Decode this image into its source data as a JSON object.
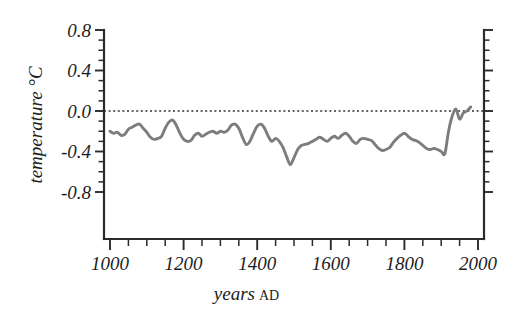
{
  "chart_data": {
    "type": "line",
    "title": "",
    "xlabel": "years AD",
    "xlabel_main": "years",
    "xlabel_suffix": "AD",
    "ylabel": "temperature °C",
    "xlim": [
      1000,
      2030
    ],
    "ylim": [
      -1.05,
      0.85
    ],
    "xticks": [
      1000,
      1200,
      1400,
      1600,
      1800,
      2000
    ],
    "xtick_labels": [
      "1000",
      "1200",
      "1400",
      "1600",
      "1800",
      "2000"
    ],
    "xminor_step": 50,
    "yticks": [
      0.8,
      0.4,
      0.0,
      -0.4,
      -0.8
    ],
    "ytick_labels": [
      "0.8",
      "0.4",
      "0.0",
      "-0.4",
      "-0.8"
    ],
    "yminor_step": 0.1,
    "grid": false,
    "legend": null,
    "zero_reference_line": 0.0,
    "line_color": "#7d7d7d",
    "axis_color": "#2b2b2b",
    "text_color": "#1d1d1d",
    "background": "#ffffff",
    "series": [
      {
        "name": "Northern Hemisphere temperature anomaly",
        "x": [
          1000,
          1010,
          1020,
          1030,
          1040,
          1050,
          1060,
          1070,
          1080,
          1090,
          1100,
          1110,
          1120,
          1130,
          1140,
          1150,
          1160,
          1170,
          1180,
          1190,
          1200,
          1210,
          1220,
          1230,
          1240,
          1250,
          1260,
          1270,
          1280,
          1290,
          1300,
          1310,
          1320,
          1330,
          1340,
          1350,
          1360,
          1370,
          1380,
          1390,
          1400,
          1410,
          1420,
          1430,
          1440,
          1450,
          1460,
          1470,
          1480,
          1490,
          1500,
          1510,
          1520,
          1530,
          1540,
          1550,
          1560,
          1570,
          1580,
          1590,
          1600,
          1610,
          1620,
          1630,
          1640,
          1650,
          1660,
          1670,
          1680,
          1690,
          1700,
          1710,
          1720,
          1730,
          1740,
          1750,
          1760,
          1770,
          1780,
          1790,
          1800,
          1810,
          1820,
          1830,
          1840,
          1850,
          1860,
          1870,
          1880,
          1890,
          1900,
          1910,
          1920,
          1930,
          1940,
          1950,
          1960,
          1970,
          1980
        ],
        "values": [
          -0.2,
          -0.22,
          -0.21,
          -0.24,
          -0.23,
          -0.18,
          -0.16,
          -0.14,
          -0.13,
          -0.17,
          -0.21,
          -0.26,
          -0.28,
          -0.27,
          -0.25,
          -0.17,
          -0.11,
          -0.09,
          -0.14,
          -0.22,
          -0.28,
          -0.3,
          -0.29,
          -0.24,
          -0.22,
          -0.25,
          -0.23,
          -0.21,
          -0.2,
          -0.22,
          -0.2,
          -0.21,
          -0.19,
          -0.14,
          -0.13,
          -0.17,
          -0.26,
          -0.33,
          -0.3,
          -0.22,
          -0.15,
          -0.13,
          -0.17,
          -0.25,
          -0.3,
          -0.27,
          -0.3,
          -0.36,
          -0.45,
          -0.53,
          -0.46,
          -0.38,
          -0.34,
          -0.33,
          -0.32,
          -0.3,
          -0.28,
          -0.26,
          -0.28,
          -0.3,
          -0.27,
          -0.25,
          -0.27,
          -0.24,
          -0.22,
          -0.25,
          -0.3,
          -0.32,
          -0.28,
          -0.27,
          -0.28,
          -0.29,
          -0.33,
          -0.37,
          -0.39,
          -0.38,
          -0.36,
          -0.31,
          -0.27,
          -0.24,
          -0.22,
          -0.25,
          -0.28,
          -0.29,
          -0.31,
          -0.34,
          -0.37,
          -0.38,
          -0.37,
          -0.38,
          -0.4,
          -0.42,
          -0.2,
          -0.05,
          0.02,
          -0.08,
          -0.02,
          0.0,
          0.04
        ]
      }
    ]
  }
}
